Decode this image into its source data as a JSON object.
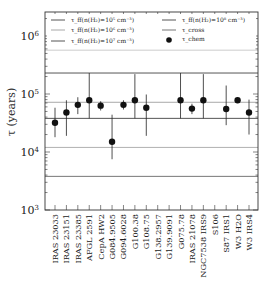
{
  "chart_data": {
    "type": "scatter",
    "title": "",
    "xlabel": "",
    "ylabel": "τ (years)",
    "yscale": "log",
    "ylim": [
      1000,
      2800000
    ],
    "y_ticks": [
      {
        "value": 1000,
        "label": "10³"
      },
      {
        "value": 10000,
        "label": "10⁴"
      },
      {
        "value": 100000,
        "label": "10⁵"
      },
      {
        "value": 1000000,
        "label": "10⁶"
      }
    ],
    "categories": [
      "IRAS 23033",
      "IRAS 23151",
      "IRAS 23385",
      "AFGL 2591",
      "CepA HW2",
      "G084.9505",
      "G094.6028",
      "G100.38",
      "G108.75",
      "G138.2957",
      "G139.9091",
      "G075.78",
      "IRAS 21078",
      "NGC7538 IRS9",
      "S106",
      "S87 IRS1",
      "W3 H2O",
      "W3 IRS4"
    ],
    "series": [
      {
        "name": "τ_chem",
        "marker": "circle",
        "color": "#111111",
        "values": [
          32000,
          48000,
          65000,
          78000,
          63000,
          15000,
          65000,
          78000,
          58000,
          null,
          null,
          78000,
          56000,
          78000,
          null,
          55000,
          78000,
          48000
        ],
        "err_low": [
          18000,
          19000,
          45000,
          38000,
          52000,
          7500,
          54000,
          38000,
          19000,
          null,
          null,
          38000,
          45000,
          38000,
          null,
          29000,
          null,
          20000
        ],
        "err_high": [
          58000,
          78000,
          88000,
          230000,
          75000,
          44000,
          78000,
          220000,
          98000,
          null,
          null,
          230000,
          68000,
          220000,
          null,
          140000,
          null,
          80000
        ]
      }
    ],
    "reference_lines": [
      {
        "name": "τ_ff(n(H₂)=10⁵ cm⁻³)",
        "value": 230000,
        "color": "#555555"
      },
      {
        "name": "τ_ff(n(H₂)=10⁶ cm⁻³)",
        "value": 72000,
        "color": "#a8a8a8"
      },
      {
        "name": "τ_ff(n(H₂)=10⁷ cm⁻³)",
        "value": 38000,
        "color": "#555555"
      },
      {
        "name": "τ_ff(n(H₂)=10⁸ cm⁻³)",
        "value": 12000,
        "color": "#b0b0b0"
      },
      {
        "name": "τ_cross",
        "value": 3800,
        "color": "#777777"
      },
      {
        "name": "τ_cross upper",
        "value": 570000,
        "color": "#cccccc"
      }
    ],
    "legend": {
      "position": "upper",
      "columns": 2,
      "entries": [
        {
          "label": "τ_ff(n(H₂)=10⁵ cm⁻³)",
          "style": "line",
          "color": "#555555"
        },
        {
          "label": "τ_ff(n(H₂)=10⁶ cm⁻³)",
          "style": "line",
          "color": "#a8a8a8"
        },
        {
          "label": "τ_ff(n(H₂)=10⁷ cm⁻³)",
          "style": "line",
          "color": "#555555"
        },
        {
          "label": "τ_ff(n(H₂)=10⁸ cm⁻³)",
          "style": "line",
          "color": "#555555"
        },
        {
          "label": "τ_cross",
          "style": "line",
          "color": "#777777"
        },
        {
          "label": "τ_chem",
          "style": "marker",
          "color": "#111111"
        }
      ]
    },
    "grid": false
  },
  "legend_labels": {
    "ff5_pre": "τ",
    "ff5_sub": "ff",
    "ff5_post": "(n(H",
    "ff5_h2": "2",
    "ff5_val": ")=10",
    "ff5_exp": "5",
    "ff5_unit": " cm",
    "ff5_uexp": "−3",
    "ff5_close": ")",
    "ff6_exp": "6",
    "ff7_exp": "7",
    "ff8_exp": "8",
    "cross_sub": "cross",
    "chem_sub": "chem"
  },
  "axis": {
    "ylabel": "τ (years)",
    "ytick_base": "10",
    "ytick_exps": [
      "6",
      "5",
      "4",
      "3"
    ]
  }
}
